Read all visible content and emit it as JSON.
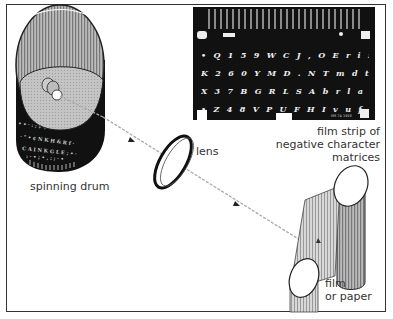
{
  "diagram": {
    "labels": {
      "drum": "spinning drum",
      "lens": "lens",
      "strip_line1": "film strip of",
      "strip_line2": "negative character",
      "strip_line3": "matrices",
      "film_line1": "film",
      "film_line2": "or paper"
    },
    "film_strip": {
      "rows": [
        "• Q 1 5 9 W C J , O E r i z o u q ° * % & $ ; : - •",
        "K 2 6 0 Y M D . N T m d t n y k ' § † ? £ ; - -",
        "X 3 7 B G R L S A b r l a s g x - ½ ‡ ! ( ) + ß",
        "• Z 4 8 V P U F H I v u f i h p z ¦ % — [ ] → ß •"
      ],
      "footer_code": "MS 74 1918"
    },
    "colors": {
      "ink": "#111111",
      "frame": "#333333",
      "gray": "#9a9a9a",
      "light_gray": "#cfcfcf",
      "background": "#ffffff"
    }
  }
}
